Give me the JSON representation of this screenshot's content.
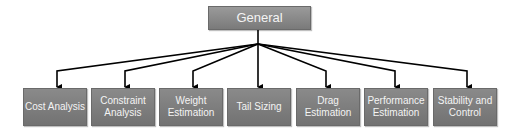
{
  "diagram": {
    "type": "tree",
    "root": {
      "label": "General"
    },
    "children": [
      {
        "label": "Cost Analysis",
        "x": 23
      },
      {
        "label": "Constraint\nAnalysis",
        "x": 91
      },
      {
        "label": "Weight\nEstimation",
        "x": 159
      },
      {
        "label": "Tail Sizing",
        "x": 227
      },
      {
        "label": "Drag\nEstimation",
        "x": 296
      },
      {
        "label": "Performance\nEstimation",
        "x": 364
      },
      {
        "label": "Stability and\nControl",
        "x": 433
      }
    ],
    "colors": {
      "node_fill": "#7a7a7a",
      "node_text": "#f4f4f4",
      "connector": "#000000"
    }
  }
}
